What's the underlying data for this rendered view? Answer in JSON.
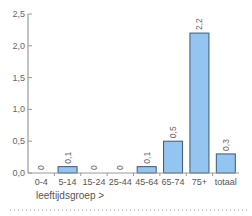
{
  "chart_data": {
    "type": "bar",
    "title": "",
    "xlabel": "leeftijdsgroep >",
    "ylabel": "",
    "ylim": [
      0,
      2.5
    ],
    "yticks": [
      "0,0",
      "0,5",
      "1,0",
      "1,5",
      "2,0",
      "2,5"
    ],
    "categories": [
      "0-4",
      "5-14",
      "15-24",
      "25-44",
      "45-64",
      "65-74",
      "75+",
      "totaal"
    ],
    "values": [
      0,
      0.1,
      0,
      0,
      0.1,
      0.5,
      2.2,
      0.3
    ],
    "value_labels": [
      "0",
      "0,1",
      "0",
      "0",
      "0,1",
      "0,5",
      "2,2",
      "0,3"
    ],
    "grid": false,
    "legend": null
  },
  "colors": {
    "bar_fill": "#93c5f0",
    "bar_stroke": "#3a5a78",
    "axis": "#999999",
    "text": "#666666",
    "dotted_rule": "#999999"
  }
}
